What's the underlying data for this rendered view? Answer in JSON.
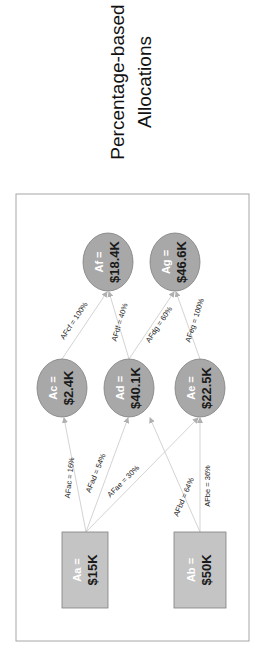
{
  "title": {
    "line1": "Percentage-based",
    "line2": "Allocations"
  },
  "colors": {
    "circle_fill": "#a8a8a8",
    "circle_stroke": "#7f7f7f",
    "box_fill": "#c4c4c4",
    "box_stroke": "#7f7f7f",
    "frame_stroke": "#a6a6a6",
    "edge_stroke": "#c8c8c8"
  },
  "nodes": {
    "Aa": {
      "label": "Aa =",
      "value": "$15K",
      "shape": "box"
    },
    "Ab": {
      "label": "Ab =",
      "value": "$50K",
      "shape": "box"
    },
    "Ac": {
      "label": "Ac =",
      "value": "$2.4K",
      "shape": "circle"
    },
    "Ad": {
      "label": "Ad =",
      "value": "$40.1K",
      "shape": "circle"
    },
    "Ae": {
      "label": "Ae =",
      "value": "$22.5K",
      "shape": "circle"
    },
    "Af": {
      "label": "Af =",
      "value": "$18.4K",
      "shape": "circle"
    },
    "Ag": {
      "label": "Ag =",
      "value": "$46.6K",
      "shape": "circle"
    }
  },
  "edges": {
    "ac": {
      "from": "Aa",
      "to": "Ac",
      "label": "AFac = 16%"
    },
    "ad": {
      "from": "Aa",
      "to": "Ad",
      "label": "AFad = 54%"
    },
    "ae": {
      "from": "Aa",
      "to": "Ae",
      "label": "AFae = 30%"
    },
    "bd": {
      "from": "Ab",
      "to": "Ad",
      "label": "AFbd = 64%"
    },
    "be": {
      "from": "Ab",
      "to": "Ae",
      "label": "AFbe = 36%"
    },
    "cf": {
      "from": "Ac",
      "to": "Af",
      "label": "AFcf = 100%"
    },
    "df": {
      "from": "Ad",
      "to": "Af",
      "label": "AFdf = 40%"
    },
    "dg": {
      "from": "Ad",
      "to": "Ag",
      "label": "AFdg = 60%"
    },
    "eg": {
      "from": "Ae",
      "to": "Ag",
      "label": "AFeg = 100%"
    }
  }
}
